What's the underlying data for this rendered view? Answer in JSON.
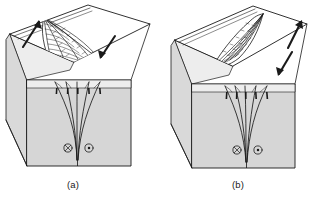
{
  "figure": {
    "type": "geological-block-diagram-pair",
    "background_color": "#ffffff",
    "line_color": "#1a1a1a",
    "panels": [
      {
        "id": "a",
        "caption": "(a)",
        "structure_name": "positive flower structure",
        "description": "Symmetric upward-splaying fan of reverse fault splays rising from a single vertical strike-slip fault; hachured fan on the eroded top surface",
        "fan_symmetry": "symmetric",
        "splay_count": 5,
        "top_face_color": "#ffffff",
        "left_face_color": "#d8d8d8",
        "front_face_color": "#d5d5d5",
        "top_arrows": [
          {
            "name": "left-block-motion-arrow",
            "direction": "up-right",
            "meaning": "relative strike-slip displacement of near block"
          },
          {
            "name": "right-block-motion-arrow",
            "direction": "down-left",
            "meaning": "relative strike-slip displacement of far block"
          }
        ],
        "front_face_symbols": [
          {
            "glyph": "cross-in-circle",
            "unicode": "⊗",
            "meaning": "motion into the page"
          },
          {
            "glyph": "dot-in-circle",
            "unicode": "⊙",
            "meaning": "motion out of the page"
          }
        ],
        "splay_tick_marks": "hachures on hanging-wall side of each splay"
      },
      {
        "id": "b",
        "caption": "(b)",
        "structure_name": "asymmetric flower structure",
        "description": "Asymmetric, steeply curved fan of fault splays leaning to the right from a single vertical strike-slip fault root; hachured fan on the eroded top surface",
        "fan_symmetry": "asymmetric",
        "splay_count": 5,
        "top_face_color": "#ffffff",
        "left_face_color": "#d8d8d8",
        "front_face_color": "#d5d5d5",
        "top_arrows": [
          {
            "name": "left-block-motion-arrow",
            "direction": "up-right",
            "meaning": "relative strike-slip displacement of near block"
          },
          {
            "name": "right-block-motion-arrow",
            "direction": "down-left",
            "meaning": "relative strike-slip displacement of far block"
          }
        ],
        "front_face_symbols": [
          {
            "glyph": "cross-in-circle",
            "unicode": "⊗",
            "meaning": "motion into the page"
          },
          {
            "glyph": "dot-in-circle",
            "unicode": "⊙",
            "meaning": "motion out of the page"
          }
        ],
        "splay_tick_marks": "hachures on hanging-wall side of each splay"
      }
    ]
  }
}
